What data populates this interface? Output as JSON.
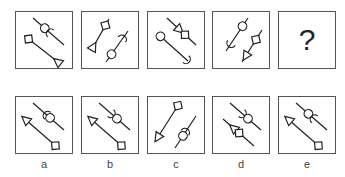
{
  "puzzle": {
    "question_row": [
      {
        "id": "q1",
        "strokes": [
          {
            "from": [
              17,
              6
            ],
            "to": [
              48,
              33
            ],
            "shapes": [
              {
                "type": "circle",
                "at": 0.38
              },
              {
                "type": "crescent",
                "at": 0.55,
                "facing": "up-left"
              }
            ]
          },
          {
            "from": [
              10,
              25
            ],
            "to": [
              42,
              50
            ],
            "shapes": [
              {
                "type": "square",
                "at": 0.08
              },
              {
                "type": "triangle",
                "at": 1.0,
                "pointing": "up-left"
              }
            ]
          }
        ]
      },
      {
        "id": "q2",
        "strokes": [
          {
            "from": [
              27,
              7
            ],
            "to": [
              9,
              39
            ],
            "shapes": [
              {
                "type": "square",
                "at": 0.2
              },
              {
                "type": "triangle",
                "at": 0.88,
                "pointing": "up-right"
              }
            ]
          },
          {
            "from": [
              46,
              19
            ],
            "to": [
              24,
              50
            ],
            "shapes": [
              {
                "type": "crescent",
                "at": 0.25,
                "facing": "up-right"
              },
              {
                "type": "circle",
                "at": 0.75
              }
            ]
          }
        ]
      },
      {
        "id": "q3",
        "strokes": [
          {
            "from": [
              19,
              6
            ],
            "to": [
              48,
              33
            ],
            "shapes": [
              {
                "type": "triangle",
                "at": 0.42,
                "pointing": "down-right"
              },
              {
                "type": "square",
                "at": 0.62
              }
            ]
          },
          {
            "from": [
              11,
              23
            ],
            "to": [
              40,
              49
            ],
            "shapes": [
              {
                "type": "circle",
                "at": 0.05
              },
              {
                "type": "crescent",
                "at": 0.95,
                "facing": "down-right"
              }
            ]
          }
        ]
      },
      {
        "id": "q4",
        "strokes": [
          {
            "from": [
              35,
              6
            ],
            "to": [
              13,
              39
            ],
            "shapes": [
              {
                "type": "circle",
                "at": 0.25
              },
              {
                "type": "crescent",
                "at": 0.78,
                "facing": "down-left"
              }
            ]
          },
          {
            "from": [
              49,
              18
            ],
            "to": [
              29,
              50
            ],
            "shapes": [
              {
                "type": "square",
                "at": 0.3
              },
              {
                "type": "triangle",
                "at": 0.8,
                "pointing": "down-left"
              }
            ]
          }
        ]
      },
      {
        "id": "q5",
        "unknown": true,
        "symbol": "?"
      }
    ],
    "answer_row": [
      {
        "id": "a",
        "label": "a",
        "strokes": [
          {
            "from": [
              17,
              6
            ],
            "to": [
              48,
              33
            ],
            "shapes": [
              {
                "type": "crescent",
                "at": 0.45,
                "facing": "up-left"
              },
              {
                "type": "circle",
                "at": 0.55
              }
            ]
          },
          {
            "from": [
              10,
              23
            ],
            "to": [
              41,
              50
            ],
            "shapes": [
              {
                "type": "arrowhead",
                "at": 0.0,
                "pointing": "up-left"
              },
              {
                "type": "square",
                "at": 0.95
              }
            ]
          }
        ]
      },
      {
        "id": "b",
        "label": "b",
        "strokes": [
          {
            "from": [
              17,
              6
            ],
            "to": [
              48,
              33
            ],
            "shapes": [
              {
                "type": "crescent",
                "at": 0.4,
                "facing": "down-right"
              },
              {
                "type": "circle",
                "at": 0.58
              }
            ]
          },
          {
            "from": [
              10,
              23
            ],
            "to": [
              41,
              50
            ],
            "shapes": [
              {
                "type": "arrowhead",
                "at": 0.0,
                "pointing": "up-left"
              },
              {
                "type": "square",
                "at": 0.95
              }
            ]
          }
        ]
      },
      {
        "id": "c",
        "label": "c",
        "strokes": [
          {
            "from": [
              31,
              7
            ],
            "to": [
              10,
              40
            ],
            "shapes": [
              {
                "type": "square",
                "at": 0.05
              },
              {
                "type": "arrowhead",
                "at": 1.0,
                "pointing": "down-left"
              }
            ]
          },
          {
            "from": [
              48,
              19
            ],
            "to": [
              27,
              51
            ],
            "shapes": [
              {
                "type": "crescent",
                "at": 0.5,
                "facing": "up-right"
              },
              {
                "type": "circle",
                "at": 0.62
              }
            ]
          }
        ]
      },
      {
        "id": "d",
        "label": "d",
        "strokes": [
          {
            "from": [
              17,
              6
            ],
            "to": [
              48,
              33
            ],
            "shapes": [
              {
                "type": "crescent",
                "at": 0.4,
                "facing": "down-right"
              },
              {
                "type": "circle",
                "at": 0.58
              }
            ]
          },
          {
            "from": [
              10,
              22
            ],
            "to": [
              41,
              49
            ],
            "shapes": [
              {
                "type": "triangle",
                "at": 0.35,
                "pointing": "up-left"
              },
              {
                "type": "square",
                "at": 0.52
              }
            ]
          }
        ]
      },
      {
        "id": "e",
        "label": "e",
        "strokes": [
          {
            "from": [
              17,
              6
            ],
            "to": [
              48,
              33
            ],
            "shapes": [
              {
                "type": "circle",
                "at": 0.4
              },
              {
                "type": "crescent",
                "at": 0.58,
                "facing": "up-left"
              }
            ]
          },
          {
            "from": [
              10,
              23
            ],
            "to": [
              41,
              50
            ],
            "shapes": [
              {
                "type": "arrowhead",
                "at": 0.0,
                "pointing": "up-left"
              },
              {
                "type": "square",
                "at": 0.95
              }
            ]
          }
        ]
      }
    ]
  },
  "layout": {
    "question_x": [
      15,
      81,
      147,
      212,
      278
    ],
    "question_y": 11,
    "answer_x": [
      15,
      81,
      147,
      212,
      278
    ],
    "answer_y": 96
  },
  "colors": {
    "stroke": "#222222",
    "border": "#555555"
  }
}
